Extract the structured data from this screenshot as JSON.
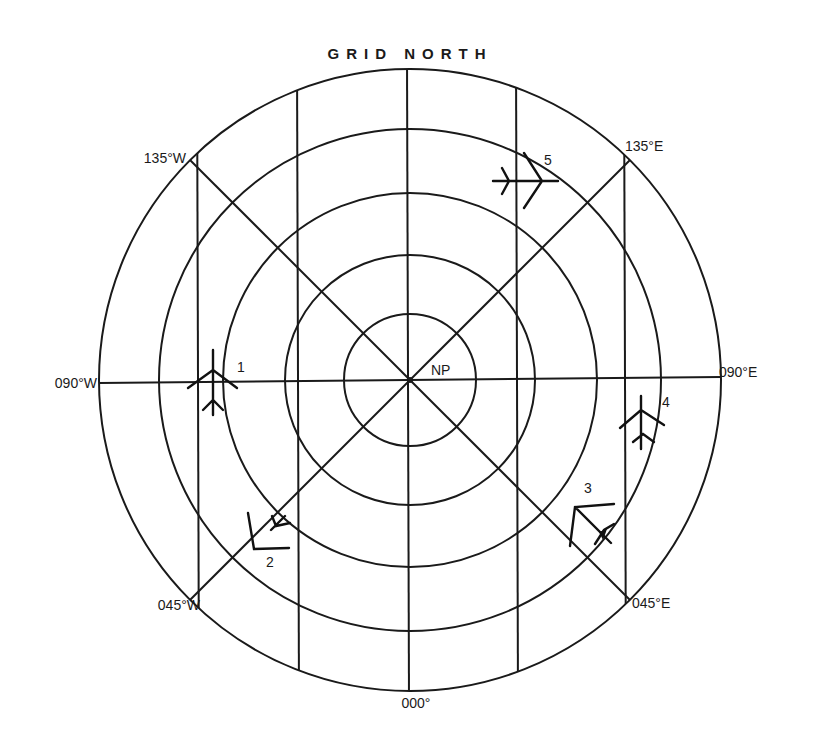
{
  "diagram": {
    "title": "GRID NORTH",
    "center_label": "NP",
    "center": [
      410,
      380
    ],
    "ring_radii": [
      66,
      125,
      187,
      251,
      311
    ],
    "vertical_grid_x": [
      197,
      298,
      408,
      517,
      625
    ],
    "meridians": [
      {
        "label": "135°W",
        "angle_deg": 135
      },
      {
        "label": "135°E",
        "angle_deg": 45
      },
      {
        "label": "090°W",
        "angle_deg": 180
      },
      {
        "label": "090°E",
        "angle_deg": 0
      },
      {
        "label": "045°W",
        "angle_deg": 225
      },
      {
        "label": "045°E",
        "angle_deg": 315
      },
      {
        "label": "000°",
        "angle_deg": 270
      }
    ],
    "labels": {
      "w135": "135°W",
      "e135": "135°E",
      "w090": "090°W",
      "e090": "090°E",
      "w045": "045°W",
      "e045": "045°E",
      "zero": "000°"
    },
    "aircraft": [
      {
        "id": "1",
        "label": "1",
        "heading": "north"
      },
      {
        "id": "2",
        "label": "2",
        "heading": "northwest"
      },
      {
        "id": "3",
        "label": "3",
        "heading": "northwest"
      },
      {
        "id": "4",
        "label": "4",
        "heading": "north"
      },
      {
        "id": "5",
        "label": "5",
        "heading": "east"
      }
    ],
    "colors": {
      "line": "#1a1a1a",
      "background": "#ffffff"
    }
  }
}
